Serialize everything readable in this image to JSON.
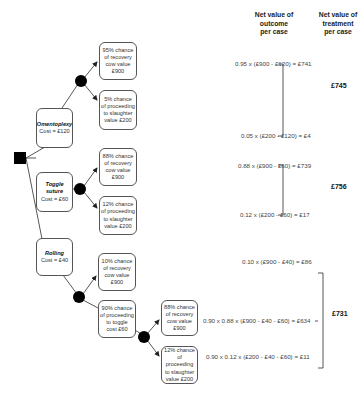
{
  "headers": {
    "outcome": [
      "Net value of",
      "outcome",
      "per case"
    ],
    "treatment": [
      "Net value of",
      "treatment",
      "per case"
    ]
  },
  "treatments": [
    {
      "name": "Omentoplexy",
      "cost": "Cost = £120"
    },
    {
      "name": "Toggle suture",
      "cost": "Cost = £60"
    },
    {
      "name": "Rolling",
      "cost": "Cost = £40"
    }
  ],
  "outcomes": {
    "omento_recovery": [
      "95% chance",
      "of recovery",
      "cow value",
      "£900"
    ],
    "omento_slaughter": [
      "5% chance",
      "of proceeding",
      "to slaughter",
      "value £200"
    ],
    "toggle_recovery": [
      "88% chance",
      "of recovery",
      "cow value",
      "£900"
    ],
    "toggle_slaughter": [
      "12% chance",
      "of proceeding",
      "to slaughter",
      "value £200"
    ],
    "rolling_recovery": [
      "10% chance",
      "of recovery",
      "cow value",
      "£900"
    ],
    "rolling_toggle": [
      "90% chance",
      "of proceeding",
      "to toggle",
      "cost £60"
    ],
    "rolling_toggle_recovery": [
      "88% chance",
      "of recovery",
      "cow value",
      "£900"
    ],
    "rolling_toggle_slaughter": [
      "12% chance",
      "of proceeding",
      "to slaughter",
      "value £200"
    ]
  },
  "calculations": {
    "omento_1": "0.95 x (£900 - £120) = £741",
    "omento_2": "0.05 x (£200 - £120) = £4",
    "toggle_1": "0.88 x (£900 - £60) = £739",
    "toggle_2": "0.12 x (£200 - £60) = £17",
    "rolling_1": "0.10 x (£900 - £40) = £86",
    "rolling_2": "0.90 x 0.88 x (£900 - £40 - £60) = £634",
    "rolling_3": "0.90 x 0.12 x (£200 - £40 - £60) = £11"
  },
  "totals": {
    "omentoplexy": "£745",
    "toggle": "£756",
    "rolling": "£731"
  }
}
